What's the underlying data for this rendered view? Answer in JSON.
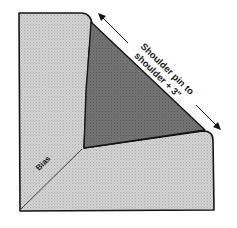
{
  "diagram": {
    "annotations": {
      "measurement_line1": "Shoulder pin to",
      "measurement_line2": "shoulder + 3\"",
      "bias_label": "Bias"
    },
    "colors": {
      "light_fabric": "#c9c9c9",
      "dark_fabric": "#6e6e6e",
      "outline": "#141414",
      "background": "#ffffff"
    }
  }
}
